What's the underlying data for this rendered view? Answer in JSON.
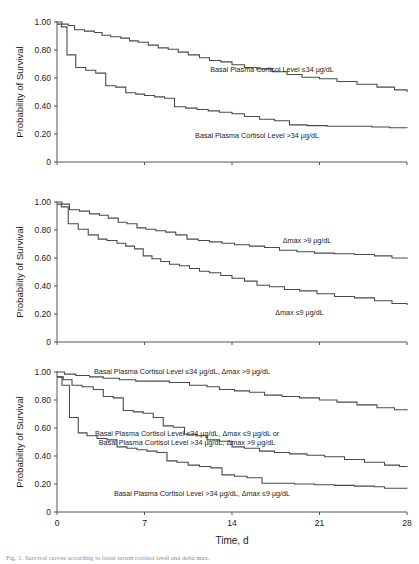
{
  "figure": {
    "title_caption": "Fig. 1. Survival curves according to basal serum cortisol level and delta max.",
    "xlabel": "Time, d",
    "ylabel": "Probability of Survival",
    "xticks": [
      "0",
      "7",
      "14",
      "21",
      "28"
    ],
    "yticks": [
      "1.00",
      "0.80",
      "0.60",
      "0.40",
      "0.20",
      "0"
    ],
    "xlim": [
      0,
      28
    ],
    "ylim": [
      0,
      1.0
    ],
    "line_color": "#4a4a4a",
    "axis_color": "#555555"
  },
  "chart_data": [
    {
      "type": "line",
      "panel": "A",
      "title": "",
      "xlabel": "",
      "ylabel": "Probability of Survival",
      "xlim": [
        0,
        28
      ],
      "ylim": [
        0,
        1.0
      ],
      "grid": false,
      "legend_position": "inline-annotation",
      "series": [
        {
          "name": "Basal Plasma Cortisol Level ≤34 µg/dL",
          "label_x": 17.2,
          "label_y": 0.645,
          "x": [
            0,
            0.4,
            0.9,
            1.4,
            2.2,
            3.0,
            3.6,
            4.3,
            5.1,
            5.8,
            6.5,
            7.3,
            8.1,
            8.9,
            9.7,
            10.5,
            11.4,
            12.2,
            13.1,
            14.0,
            15.0,
            16.0,
            17.2,
            18.4,
            19.6,
            21.0,
            22.4,
            24.0,
            25.6,
            27.0,
            28
          ],
          "y": [
            1.0,
            0.985,
            0.975,
            0.945,
            0.935,
            0.925,
            0.905,
            0.895,
            0.885,
            0.865,
            0.855,
            0.835,
            0.815,
            0.805,
            0.785,
            0.765,
            0.745,
            0.725,
            0.715,
            0.695,
            0.675,
            0.665,
            0.645,
            0.625,
            0.605,
            0.595,
            0.575,
            0.555,
            0.535,
            0.515,
            0.5
          ]
        },
        {
          "name": "Basal Plasma Cortisol Level >34 µg/dL",
          "label_x": 16.0,
          "label_y": 0.175,
          "x": [
            0,
            0.35,
            0.8,
            1.5,
            2.3,
            3.1,
            3.9,
            4.7,
            5.5,
            6.3,
            7.0,
            7.8,
            8.6,
            9.4,
            10.3,
            11.2,
            12.1,
            13.0,
            14.0,
            15.0,
            16.2,
            17.4,
            18.6,
            20.0,
            21.6,
            23.4,
            25.2,
            26.6,
            28
          ],
          "y": [
            0.985,
            0.965,
            0.765,
            0.675,
            0.655,
            0.635,
            0.545,
            0.535,
            0.495,
            0.485,
            0.475,
            0.465,
            0.455,
            0.395,
            0.385,
            0.375,
            0.365,
            0.355,
            0.345,
            0.325,
            0.305,
            0.295,
            0.265,
            0.26,
            0.255,
            0.255,
            0.25,
            0.245,
            0.243
          ]
        }
      ]
    },
    {
      "type": "line",
      "panel": "B",
      "title": "",
      "xlabel": "",
      "ylabel": "Probability of Survival",
      "xlim": [
        0,
        28
      ],
      "ylim": [
        0,
        1.0
      ],
      "grid": false,
      "legend_position": "inline-annotation",
      "series": [
        {
          "name": "Δmax >9 µg/dL",
          "label_x": 20.0,
          "label_y": 0.705,
          "x": [
            0,
            0.4,
            1.0,
            1.8,
            2.6,
            3.4,
            4.1,
            4.9,
            5.6,
            6.4,
            7.1,
            7.9,
            8.7,
            9.5,
            10.4,
            11.3,
            12.2,
            13.2,
            14.2,
            15.4,
            16.6,
            17.8,
            19.2,
            20.6,
            22.2,
            23.8,
            25.4,
            26.8,
            28
          ],
          "y": [
            1.0,
            0.985,
            0.945,
            0.935,
            0.915,
            0.905,
            0.885,
            0.855,
            0.845,
            0.815,
            0.805,
            0.795,
            0.785,
            0.765,
            0.735,
            0.725,
            0.715,
            0.705,
            0.695,
            0.685,
            0.675,
            0.655,
            0.645,
            0.635,
            0.63,
            0.625,
            0.615,
            0.6,
            0.595
          ]
        },
        {
          "name": "Δmax ≤9 µg/dL",
          "label_x": 19.4,
          "label_y": 0.195,
          "x": [
            0,
            0.35,
            0.9,
            1.7,
            2.5,
            3.3,
            4.0,
            4.8,
            5.5,
            6.2,
            6.9,
            7.6,
            8.3,
            9.0,
            9.8,
            10.6,
            11.4,
            12.2,
            13.1,
            14.0,
            15.0,
            16.0,
            17.0,
            18.2,
            19.4,
            20.8,
            22.2,
            23.8,
            25.4,
            26.8,
            28
          ],
          "y": [
            0.985,
            0.965,
            0.845,
            0.805,
            0.765,
            0.735,
            0.725,
            0.705,
            0.685,
            0.665,
            0.615,
            0.595,
            0.575,
            0.555,
            0.545,
            0.525,
            0.505,
            0.495,
            0.475,
            0.455,
            0.435,
            0.405,
            0.395,
            0.375,
            0.365,
            0.345,
            0.325,
            0.315,
            0.295,
            0.275,
            0.265
          ]
        }
      ]
    },
    {
      "type": "line",
      "panel": "C",
      "title": "",
      "xlabel": "Time, d",
      "ylabel": "Probability of Survival",
      "xlim": [
        0,
        28
      ],
      "ylim": [
        0,
        1.0
      ],
      "grid": false,
      "legend_position": "inline-annotation",
      "series": [
        {
          "name": "Basal Plasma Cortisol Level ≤34 µg/dL, Δmax >9 µg/dL",
          "label_x": 10.0,
          "label_y": 0.985,
          "x": [
            0,
            0.6,
            1.5,
            2.6,
            3.7,
            5.0,
            6.3,
            7.6,
            9.0,
            10.6,
            12.0,
            13.0,
            14.2,
            15.4,
            16.6,
            18.0,
            19.4,
            21.0,
            22.4,
            24.0,
            25.6,
            27.0,
            28
          ],
          "y": [
            1.0,
            0.985,
            0.975,
            0.965,
            0.955,
            0.945,
            0.935,
            0.935,
            0.925,
            0.905,
            0.895,
            0.875,
            0.865,
            0.855,
            0.835,
            0.825,
            0.815,
            0.8,
            0.785,
            0.765,
            0.745,
            0.73,
            0.725
          ]
        },
        {
          "name": "Basal Plasma Cortisol Level ≤34 µg/dL, Δmax ≤9 µg/dL or Basal Plasma Cortisol Level >34 µg/dL, Δmax >9 µg/dL",
          "label_x": 10.4,
          "label_y": 0.545,
          "x": [
            0,
            0.5,
            1.2,
            2.0,
            2.9,
            3.7,
            4.5,
            5.3,
            6.1,
            6.9,
            7.7,
            8.5,
            9.3,
            10.2,
            11.1,
            12.0,
            13.0,
            14.0,
            15.0,
            16.2,
            17.4,
            18.6,
            20.0,
            21.4,
            23.0,
            24.6,
            26.2,
            27.4,
            28
          ],
          "y": [
            0.965,
            0.945,
            0.905,
            0.895,
            0.875,
            0.825,
            0.815,
            0.725,
            0.715,
            0.705,
            0.675,
            0.615,
            0.605,
            0.555,
            0.545,
            0.515,
            0.505,
            0.465,
            0.455,
            0.435,
            0.425,
            0.415,
            0.405,
            0.395,
            0.375,
            0.355,
            0.335,
            0.325,
            0.32
          ]
        },
        {
          "name": "Basal Plasma Cortisol Level >34 µg/dL, Δmax ≤9 µg/dL",
          "label_x": 11.6,
          "label_y": 0.115,
          "x": [
            0,
            0.4,
            1.0,
            1.7,
            2.4,
            3.2,
            4.0,
            4.8,
            5.6,
            6.4,
            7.2,
            8.0,
            8.8,
            9.6,
            10.5,
            11.4,
            12.3,
            13.2,
            14.2,
            15.2,
            16.4,
            17.6,
            19.0,
            20.6,
            22.2,
            23.8,
            25.4,
            26.2,
            28
          ],
          "y": [
            0.965,
            0.905,
            0.675,
            0.565,
            0.545,
            0.525,
            0.515,
            0.465,
            0.455,
            0.445,
            0.435,
            0.425,
            0.365,
            0.355,
            0.335,
            0.325,
            0.315,
            0.265,
            0.255,
            0.245,
            0.205,
            0.205,
            0.2,
            0.195,
            0.19,
            0.185,
            0.18,
            0.17,
            0.168
          ]
        }
      ]
    }
  ]
}
